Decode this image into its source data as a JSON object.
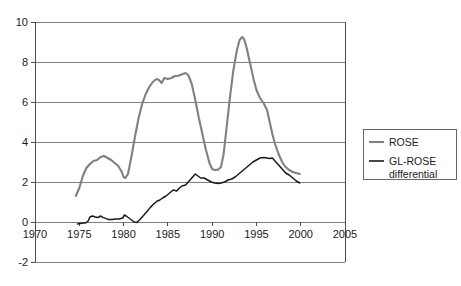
{
  "chart_data": {
    "type": "line",
    "title": "",
    "xlabel": "",
    "ylabel": "",
    "xlim": [
      1970,
      2005
    ],
    "ylim": [
      -2,
      10
    ],
    "xticks": [
      1970,
      1975,
      1980,
      1985,
      1990,
      1995,
      2000,
      2005
    ],
    "yticks": [
      -2,
      0,
      2,
      4,
      6,
      8,
      10
    ],
    "grid": "horizontal",
    "legend_position": "right-outside",
    "colors": {
      "rose": "#808080",
      "gl_rose": "#1a1a1a",
      "gridline": "#808080",
      "axis": "#4d4d4d",
      "background": "#ffffff",
      "text": "#1a1a1a",
      "legend_border": "#666666"
    },
    "series": [
      {
        "name": "ROSE",
        "color": "#808080",
        "x": [
          1974.6,
          1975.0,
          1975.4,
          1975.8,
          1976.2,
          1976.6,
          1977.0,
          1977.4,
          1977.8,
          1978.2,
          1978.6,
          1979.0,
          1979.4,
          1979.8,
          1980.0,
          1980.2,
          1980.5,
          1980.9,
          1981.3,
          1981.7,
          1982.1,
          1982.5,
          1982.9,
          1983.3,
          1983.7,
          1984.0,
          1984.3,
          1984.6,
          1985.0,
          1985.4,
          1985.8,
          1986.1,
          1986.4,
          1986.7,
          1987.0,
          1987.3,
          1987.7,
          1988.1,
          1988.5,
          1988.9,
          1989.3,
          1989.7,
          1990.0,
          1990.3,
          1990.7,
          1991.0,
          1991.3,
          1991.6,
          1992.0,
          1992.4,
          1992.8,
          1993.1,
          1993.4,
          1993.6,
          1993.9,
          1994.3,
          1994.7,
          1995.0,
          1995.4,
          1995.8,
          1996.2,
          1996.5,
          1996.8,
          1997.1,
          1997.5,
          1997.9,
          1998.3,
          1998.7,
          1999.1,
          1999.5,
          1999.9
        ],
        "y": [
          1.3,
          1.7,
          2.3,
          2.7,
          2.9,
          3.05,
          3.1,
          3.25,
          3.3,
          3.2,
          3.1,
          2.95,
          2.8,
          2.5,
          2.25,
          2.2,
          2.4,
          3.3,
          4.3,
          5.2,
          5.9,
          6.4,
          6.75,
          7.0,
          7.15,
          7.1,
          6.95,
          7.2,
          7.15,
          7.2,
          7.3,
          7.3,
          7.35,
          7.4,
          7.45,
          7.35,
          6.9,
          6.1,
          5.2,
          4.4,
          3.6,
          2.95,
          2.65,
          2.6,
          2.62,
          2.75,
          3.4,
          4.6,
          6.2,
          7.6,
          8.6,
          9.1,
          9.25,
          9.15,
          8.7,
          7.9,
          7.1,
          6.6,
          6.2,
          5.95,
          5.6,
          5.0,
          4.4,
          3.9,
          3.4,
          3.0,
          2.75,
          2.6,
          2.5,
          2.45,
          2.4
        ]
      },
      {
        "name": "GL-ROSE differential",
        "color": "#1a1a1a",
        "x": [
          1974.8,
          1975.1,
          1975.4,
          1975.7,
          1976.0,
          1976.2,
          1976.5,
          1976.8,
          1977.1,
          1977.4,
          1977.7,
          1978.0,
          1978.3,
          1978.7,
          1979.1,
          1979.5,
          1979.9,
          1980.1,
          1980.3,
          1980.6,
          1980.9,
          1981.2,
          1981.5,
          1981.8,
          1982.2,
          1982.6,
          1983.0,
          1983.4,
          1983.8,
          1984.1,
          1984.4,
          1984.8,
          1985.2,
          1985.6,
          1986.0,
          1986.3,
          1986.6,
          1987.0,
          1987.4,
          1987.8,
          1988.1,
          1988.4,
          1988.7,
          1989.1,
          1989.5,
          1989.9,
          1990.3,
          1990.7,
          1991.0,
          1991.4,
          1991.8,
          1992.2,
          1992.6,
          1993.0,
          1993.4,
          1993.8,
          1994.2,
          1994.6,
          1995.0,
          1995.4,
          1995.8,
          1996.2,
          1996.5,
          1996.8,
          1997.1,
          1997.5,
          1997.9,
          1998.3,
          1998.7,
          1999.1,
          1999.5,
          1999.9
        ],
        "y": [
          -0.1,
          -0.08,
          -0.05,
          -0.05,
          0.05,
          0.25,
          0.3,
          0.25,
          0.22,
          0.3,
          0.22,
          0.18,
          0.12,
          0.12,
          0.15,
          0.15,
          0.2,
          0.35,
          0.3,
          0.2,
          0.1,
          0.0,
          -0.02,
          0.1,
          0.3,
          0.5,
          0.72,
          0.9,
          1.05,
          1.1,
          1.2,
          1.3,
          1.45,
          1.6,
          1.55,
          1.7,
          1.8,
          1.85,
          2.05,
          2.25,
          2.4,
          2.3,
          2.2,
          2.2,
          2.1,
          2.0,
          1.95,
          1.92,
          1.95,
          2.0,
          2.1,
          2.15,
          2.25,
          2.4,
          2.55,
          2.7,
          2.85,
          3.0,
          3.1,
          3.2,
          3.22,
          3.2,
          3.18,
          3.2,
          3.05,
          2.85,
          2.65,
          2.45,
          2.35,
          2.2,
          2.05,
          1.95
        ]
      }
    ]
  },
  "axes": {
    "y_tick_labels": [
      "10",
      "8",
      "6",
      "4",
      "2",
      "0",
      "-2"
    ],
    "x_tick_labels": [
      "1970",
      "1975",
      "1980",
      "1985",
      "1990",
      "1995",
      "2000",
      "2005"
    ]
  },
  "legend": {
    "entries": [
      {
        "label": "ROSE",
        "label2": "",
        "color": "#808080"
      },
      {
        "label": "GL-ROSE",
        "label2": "differential",
        "color": "#1a1a1a"
      }
    ]
  }
}
